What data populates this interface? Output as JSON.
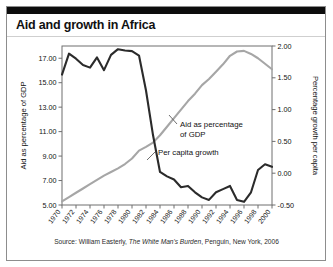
{
  "figure": {
    "title": "Aid and growth in Africa",
    "source_prefix": "Source: William Easterly, ",
    "source_italic": "The White Man's Burden",
    "source_suffix": ", Penguin, New York, 2006"
  },
  "colors": {
    "aid_line": "#a6a6a6",
    "growth_line": "#2b2b2b",
    "frame": "#8d8d8d",
    "top_bar": "#0d0d0d"
  },
  "annotations": {
    "aid_label_line1": "Aid as percentage",
    "aid_label_line2": "of GDP",
    "growth_label": "Per capita growth"
  },
  "chart_data": {
    "type": "line",
    "title": "Aid and growth in Africa",
    "xlabel": "",
    "ylabel": "Aid as percentage of GDP",
    "y2label": "Percentage growth per capita",
    "grid": false,
    "legend": "annotations-inline",
    "xlim": [
      1970,
      2000
    ],
    "ylim": [
      5.0,
      18.0
    ],
    "y2lim": [
      -0.5,
      2.0
    ],
    "yticks": [
      5.0,
      7.0,
      9.0,
      11.0,
      13.0,
      15.0,
      17.0
    ],
    "ytick_labels": [
      "5.00",
      "7.00",
      "9.00",
      "11.00",
      "13.00",
      "15.00",
      "17.00"
    ],
    "y2ticks": [
      -0.5,
      0.0,
      0.5,
      1.0,
      1.5,
      2.0
    ],
    "y2tick_labels": [
      "-0.50",
      "0.00",
      "0.50",
      "1.00",
      "1.50",
      "2.00"
    ],
    "xticks": [
      1970,
      1972,
      1974,
      1976,
      1978,
      1980,
      1982,
      1984,
      1986,
      1988,
      1990,
      1992,
      1994,
      1996,
      1998,
      2000
    ],
    "xtick_labels": [
      "1970",
      "1972",
      "1974",
      "1976",
      "1978",
      "1980",
      "1982",
      "1984",
      "1986",
      "1988",
      "1990",
      "1992",
      "1994",
      "1996",
      "1998",
      "2000"
    ],
    "x": [
      1970,
      1971,
      1972,
      1973,
      1974,
      1975,
      1976,
      1977,
      1978,
      1979,
      1980,
      1981,
      1982,
      1983,
      1984,
      1985,
      1986,
      1987,
      1988,
      1989,
      1990,
      1991,
      1992,
      1993,
      1994,
      1995,
      1996,
      1997,
      1998,
      1999,
      2000
    ],
    "series": [
      {
        "name": "Aid as percentage of GDP",
        "axis": "right_scale_left_values",
        "color": "#a6a6a6",
        "values": [
          5.3,
          5.65,
          6.0,
          6.35,
          6.7,
          7.05,
          7.4,
          7.7,
          8.0,
          8.35,
          8.8,
          9.45,
          9.75,
          10.1,
          10.7,
          11.4,
          12.1,
          12.8,
          13.5,
          14.1,
          14.8,
          15.3,
          15.9,
          16.5,
          17.2,
          17.55,
          17.6,
          17.35,
          17.0,
          16.55,
          16.1
        ]
      },
      {
        "name": "Per capita growth",
        "axis": "right",
        "color": "#2b2b2b",
        "values": [
          1.55,
          1.88,
          1.8,
          1.7,
          1.66,
          1.82,
          1.62,
          1.86,
          1.95,
          1.93,
          1.92,
          1.85,
          1.3,
          0.6,
          0.02,
          -0.05,
          -0.1,
          -0.22,
          -0.2,
          -0.3,
          -0.38,
          -0.42,
          -0.3,
          -0.25,
          -0.2,
          -0.42,
          -0.45,
          -0.3,
          0.05,
          0.14,
          0.1
        ]
      }
    ]
  }
}
